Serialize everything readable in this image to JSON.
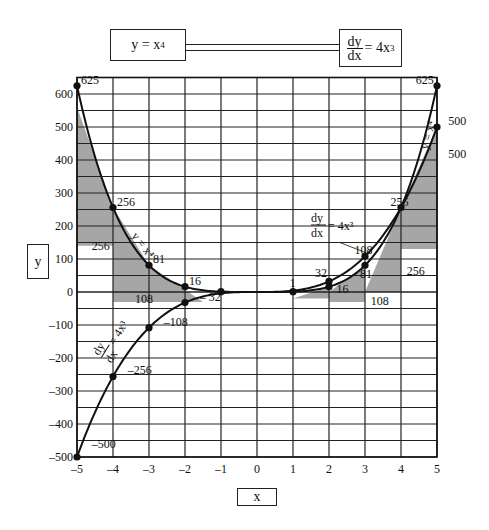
{
  "header": {
    "left_box": {
      "base": "y = x",
      "exp": "4"
    },
    "right_box": {
      "num": "dy",
      "den": "dx",
      "rhs": "= 4x",
      "exp": "3"
    }
  },
  "axes": {
    "xlabel": "x",
    "ylabel": "y"
  },
  "chart_data": {
    "type": "line",
    "xlabel": "x",
    "ylabel": "y",
    "xlim": [
      -5,
      5
    ],
    "ylim": [
      -500,
      650
    ],
    "grid": true,
    "x_ticks": [
      -5,
      -4,
      -3,
      -2,
      -1,
      0,
      1,
      2,
      3,
      4,
      5
    ],
    "y_ticks": [
      -500,
      -400,
      -300,
      -200,
      -100,
      0,
      100,
      200,
      300,
      400,
      500,
      600
    ],
    "series": [
      {
        "name": "y = x^4",
        "x": [
          -5,
          -4,
          -3,
          -2,
          -1,
          0,
          1,
          2,
          3,
          4,
          5
        ],
        "values": [
          625,
          256,
          81,
          16,
          1,
          0,
          1,
          16,
          81,
          256,
          625
        ],
        "marked_points": [
          [
            -5,
            625
          ],
          [
            -4,
            256
          ],
          [
            -3,
            81
          ],
          [
            -2,
            16
          ],
          [
            -1,
            1
          ],
          [
            1,
            1
          ],
          [
            2,
            16
          ],
          [
            3,
            81
          ],
          [
            4,
            256
          ],
          [
            5,
            625
          ]
        ]
      },
      {
        "name": "dy/dx = 4x^3",
        "x": [
          -5,
          -4,
          -3,
          -2,
          -1,
          0,
          1,
          2,
          3,
          4,
          5
        ],
        "values": [
          -500,
          -256,
          -108,
          -32,
          -4,
          0,
          4,
          32,
          108,
          256,
          500
        ],
        "marked_points": [
          [
            -5,
            -500
          ],
          [
            -4,
            -256
          ],
          [
            -3,
            -108
          ],
          [
            -2,
            -32
          ],
          [
            2,
            32
          ],
          [
            3,
            108
          ],
          [
            5,
            500
          ]
        ]
      }
    ],
    "annotations": [
      {
        "text": "625",
        "x": -5,
        "y": 625
      },
      {
        "text": "256",
        "x": -4,
        "y": 256
      },
      {
        "text": "81",
        "x": -3,
        "y": 81
      },
      {
        "text": "16",
        "x": -2,
        "y": 16
      },
      {
        "text": "256",
        "x": -4.7,
        "y": 120
      },
      {
        "text": "108",
        "x": -3.5,
        "y": -40
      },
      {
        "text": "– 32",
        "x": -1.7,
        "y": -32
      },
      {
        "text": "–108",
        "x": -2.7,
        "y": -108
      },
      {
        "text": "–256",
        "x": -3.7,
        "y": -256
      },
      {
        "text": "–500",
        "x": -4.7,
        "y": -480
      },
      {
        "text": "1",
        "x": 0.8,
        "y": 10
      },
      {
        "text": "32",
        "x": 1.5,
        "y": 38
      },
      {
        "text": "16",
        "x": 2.1,
        "y": -10
      },
      {
        "text": "81",
        "x": 2.75,
        "y": 35
      },
      {
        "text": "108",
        "x": 2.6,
        "y": 108
      },
      {
        "text": "108",
        "x": 3.05,
        "y": -45
      },
      {
        "text": "256",
        "x": 3.6,
        "y": 256
      },
      {
        "text": "256",
        "x": 4.05,
        "y": 45
      },
      {
        "text": "625",
        "x": 4.3,
        "y": 625
      },
      {
        "text": "500",
        "x": 5.2,
        "y": 500
      },
      {
        "text": "500",
        "x": 5.2,
        "y": 400
      }
    ],
    "shaded_triangles": [
      {
        "desc": "tangent slope at x=-4",
        "points": [
          [
            -5,
            560
          ],
          [
            -5,
            140
          ],
          [
            -4,
            140
          ],
          [
            -4,
            256
          ]
        ]
      },
      {
        "desc": "tangent slope at x=-3",
        "points": [
          [
            -4,
            256
          ],
          [
            -4,
            -30
          ],
          [
            -3,
            -30
          ],
          [
            -3,
            81
          ]
        ]
      },
      {
        "desc": "tangent slope at x=-2",
        "points": [
          [
            -3,
            81
          ],
          [
            -3,
            -30
          ],
          [
            -1.5,
            -30
          ]
        ]
      },
      {
        "desc": "tangent slope at x=2",
        "points": [
          [
            1,
            -20
          ],
          [
            2,
            -20
          ],
          [
            2,
            16
          ]
        ]
      },
      {
        "desc": "tangent slope at x=3",
        "points": [
          [
            2,
            -30
          ],
          [
            3,
            -30
          ],
          [
            3,
            81
          ],
          [
            2,
            0
          ]
        ]
      },
      {
        "desc": "tangent slope at x=4",
        "points": [
          [
            3,
            0
          ],
          [
            4,
            0
          ],
          [
            4,
            256
          ]
        ]
      },
      {
        "desc": "tangent slope at x=5",
        "points": [
          [
            4,
            130
          ],
          [
            5,
            130
          ],
          [
            5,
            500
          ],
          [
            4,
            256
          ]
        ]
      }
    ],
    "curve_labels": [
      {
        "text": "y = x^4",
        "side": "left",
        "x": -3.5,
        "y": 170
      },
      {
        "text": "dy/dx = 4x^3",
        "side": "left",
        "x": -4.3,
        "y": -200
      },
      {
        "text": "y = x^4",
        "side": "right",
        "x": 4.75,
        "y": 430
      },
      {
        "text": "dy/dx = 4x^3",
        "side": "right",
        "x": 1.5,
        "y": 200
      }
    ]
  }
}
